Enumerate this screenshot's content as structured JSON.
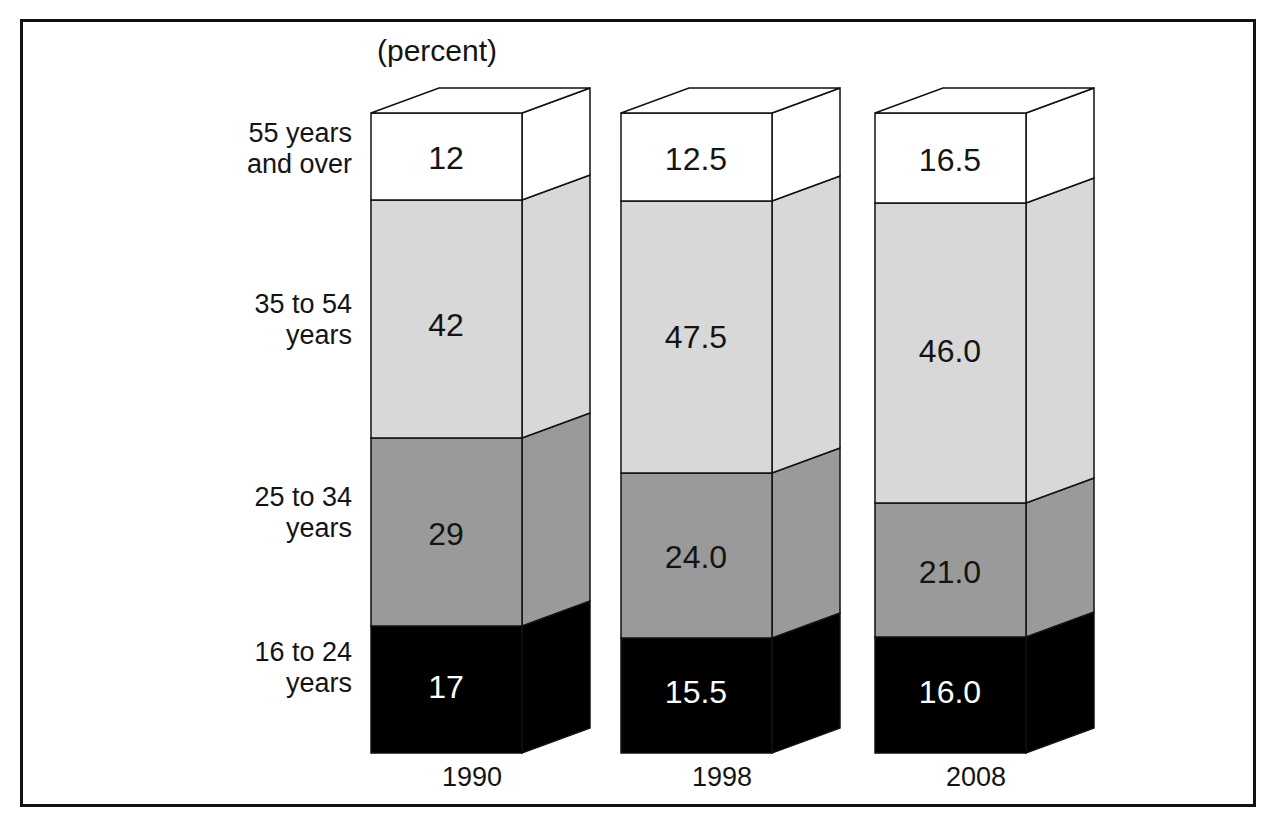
{
  "frame": {
    "border_color": "#111111"
  },
  "axis": {
    "unit_label": "(percent)"
  },
  "category_labels": [
    "55 years\nand over",
    "35 to 54\nyears",
    "25 to 34\nyears",
    "16 to 24\nyears"
  ],
  "years": [
    "1990",
    "1998",
    "2008"
  ],
  "segment_colors": {
    "55 years and over": "#ffffff",
    "35 to 54 years": "#d8d8d8",
    "25 to 34 years": "#9a9a9a",
    "16 to 24 years": "#000000"
  },
  "value_text_colors": {
    "55 years and over": "#141414",
    "35 to 54 years": "#141414",
    "25 to 34 years": "#141414",
    "16 to 24 years": "#ffffff"
  },
  "labels_1990": {
    "s55": "12",
    "s35": "42",
    "s25": "29",
    "s16": "17"
  },
  "labels_1998": {
    "s55": "12.5",
    "s35": "47.5",
    "s25": "24.0",
    "s16": "15.5"
  },
  "labels_2008": {
    "s55": "16.5",
    "s35": "46.0",
    "s25": "21.0",
    "s16": "16.0"
  },
  "chart_data": {
    "type": "bar",
    "title": "",
    "subtitle": "",
    "xlabel": "",
    "ylabel": "(percent)",
    "stacked": true,
    "orientation": "vertical",
    "grid": false,
    "legend": "left-side category labels",
    "ylim": [
      0,
      100
    ],
    "categories": [
      "1990",
      "1998",
      "2008"
    ],
    "series": [
      {
        "name": "16 to 24 years",
        "values": [
          17,
          15.5,
          16.0
        ],
        "color": "#000000",
        "label_color": "#ffffff"
      },
      {
        "name": "25 to 34 years",
        "values": [
          29,
          24.0,
          21.0
        ],
        "color": "#9a9a9a",
        "label_color": "#141414"
      },
      {
        "name": "35 to 54 years",
        "values": [
          42,
          47.5,
          46.0
        ],
        "color": "#d8d8d8",
        "label_color": "#141414"
      },
      {
        "name": "55 years and over",
        "values": [
          12,
          12.5,
          16.5
        ],
        "color": "#ffffff",
        "label_color": "#141414"
      }
    ],
    "data_labels": [
      {
        "category": "1990",
        "series": "55 years and over",
        "text": "12"
      },
      {
        "category": "1990",
        "series": "35 to 54 years",
        "text": "42"
      },
      {
        "category": "1990",
        "series": "25 to 34 years",
        "text": "29"
      },
      {
        "category": "1990",
        "series": "16 to 24 years",
        "text": "17"
      },
      {
        "category": "1998",
        "series": "55 years and over",
        "text": "12.5"
      },
      {
        "category": "1998",
        "series": "35 to 54 years",
        "text": "47.5"
      },
      {
        "category": "1998",
        "series": "25 to 34 years",
        "text": "24.0"
      },
      {
        "category": "1998",
        "series": "16 to 24 years",
        "text": "15.5"
      },
      {
        "category": "2008",
        "series": "55 years and over",
        "text": "16.5"
      },
      {
        "category": "2008",
        "series": "35 to 54 years",
        "text": "46.0"
      },
      {
        "category": "2008",
        "series": "25 to 34 years",
        "text": "21.0"
      },
      {
        "category": "2008",
        "series": "16 to 24 years",
        "text": "16.0"
      }
    ]
  }
}
